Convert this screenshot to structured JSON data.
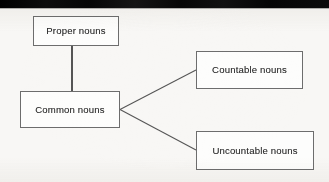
{
  "page": {
    "background_color": "#f8f7f5",
    "band_color": "#080808",
    "box_border_color": "#6d6d6d",
    "box_fill_color": "#fdfdfc",
    "line_color": "#555555",
    "text_color": "#2b2b2b"
  },
  "diagram": {
    "type": "tree",
    "nodes": [
      {
        "id": "proper",
        "label": "Proper nouns"
      },
      {
        "id": "common",
        "label": "Common nouns"
      },
      {
        "id": "countable",
        "label": "Countable nouns"
      },
      {
        "id": "uncountable",
        "label": "Uncountable nouns"
      }
    ],
    "edges": [
      {
        "from": "proper",
        "to": "common"
      },
      {
        "from": "common",
        "to": "countable"
      },
      {
        "from": "common",
        "to": "uncountable"
      }
    ]
  }
}
